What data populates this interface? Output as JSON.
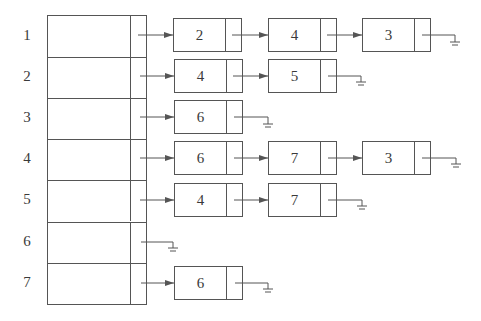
{
  "diagram": {
    "type": "adjacency-list",
    "colors": {
      "line": "#555555",
      "text": "#3a3a3a",
      "background": "#ffffff"
    },
    "vertices": [
      "1",
      "2",
      "3",
      "4",
      "5",
      "6",
      "7"
    ],
    "adjacency": [
      {
        "vertex": "1",
        "neighbors": [
          "2",
          "4",
          "3"
        ]
      },
      {
        "vertex": "2",
        "neighbors": [
          "4",
          "5"
        ]
      },
      {
        "vertex": "3",
        "neighbors": [
          "6"
        ]
      },
      {
        "vertex": "4",
        "neighbors": [
          "6",
          "7",
          "3"
        ]
      },
      {
        "vertex": "5",
        "neighbors": [
          "4",
          "7"
        ]
      },
      {
        "vertex": "6",
        "neighbors": []
      },
      {
        "vertex": "7",
        "neighbors": [
          "6"
        ]
      }
    ],
    "null_symbol": "ground-icon"
  }
}
